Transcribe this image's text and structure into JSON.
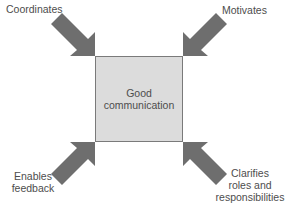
{
  "diagram": {
    "center": {
      "line1": "Good",
      "line2": "communication"
    },
    "arrows": [
      {
        "position": "top-left",
        "label": [
          "Coordinates"
        ]
      },
      {
        "position": "top-right",
        "label": [
          "Motivates"
        ]
      },
      {
        "position": "bottom-left",
        "label": [
          "Enables",
          "feedback"
        ]
      },
      {
        "position": "bottom-right",
        "label": [
          "Clarifies",
          "roles and",
          "responsibilities"
        ]
      }
    ],
    "colors": {
      "arrow": "#6e6e6e",
      "box_fill": "#dcdcdc",
      "box_border": "#7a7a7a"
    }
  }
}
